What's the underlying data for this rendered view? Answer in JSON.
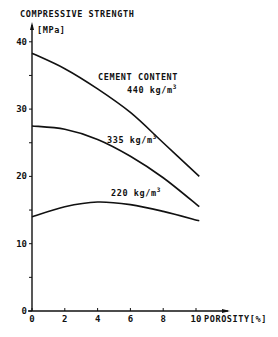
{
  "chart_data": {
    "type": "line",
    "title": "COMPRESSIVE STRENGTH",
    "ylabel": "[MPa]",
    "xlabel": "POROSITY[%]",
    "xlim": [
      0,
      11
    ],
    "ylim": [
      0,
      42
    ],
    "x_ticks": [
      "0",
      "2",
      "4",
      "6",
      "8",
      "10"
    ],
    "y_ticks": [
      "0",
      "10",
      "20",
      "30",
      "40"
    ],
    "grid": false,
    "legend_title": "CEMENT CONTENT",
    "series": [
      {
        "name": "440 kg/m3",
        "x": [
          0,
          2,
          4,
          6,
          8,
          10.2
        ],
        "values": [
          38.3,
          36,
          33,
          29.5,
          25,
          20
        ]
      },
      {
        "name": "335 kg/m3",
        "x": [
          0,
          2,
          4,
          6,
          8,
          10.2
        ],
        "values": [
          27.5,
          27,
          25.5,
          23,
          19.8,
          15.5
        ]
      },
      {
        "name": "220 kg/m3",
        "x": [
          0,
          2,
          4,
          6,
          8,
          10.2
        ],
        "values": [
          14,
          15.5,
          16.2,
          15.8,
          14.8,
          13.4
        ]
      }
    ]
  },
  "labels": {
    "title": "COMPRESSIVE STRENGTH",
    "yunit": "[MPa]",
    "xlabel": "POROSITY[%]",
    "legend_title": "CEMENT CONTENT",
    "s440": "440 kg/m",
    "s335": "335 kg/m",
    "s220": "220 kg/m",
    "sup": "3"
  }
}
